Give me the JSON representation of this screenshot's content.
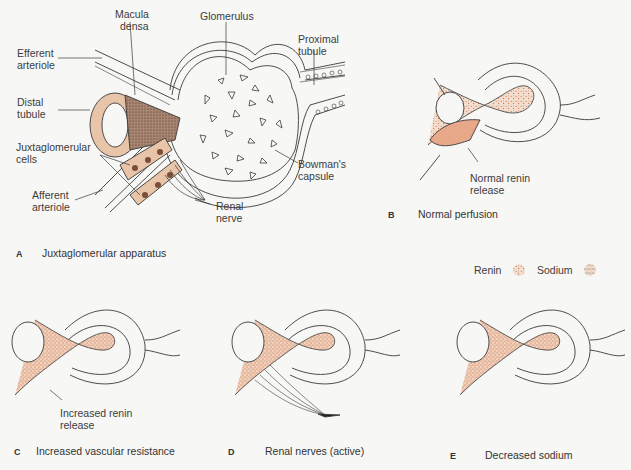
{
  "colors": {
    "background": "#f7f7f5",
    "line": "#3a3a3a",
    "cell_fill": "#e8c4a8",
    "renin": "#d9734e",
    "sodium": "#333333",
    "tube_fill": "#f2dccb",
    "macula_fill": "#8a6a58",
    "nucleus": "#7a4e38"
  },
  "panel_a": {
    "letter": "A",
    "caption": "Juxtaglomerular apparatus",
    "labels": {
      "macula_densa_1": "Macula",
      "macula_densa_2": "densa",
      "glomerulus": "Glomerulus",
      "proximal_tubule_1": "Proximal",
      "proximal_tubule_2": "tubule",
      "efferent_arteriole_1": "Efferent",
      "efferent_arteriole_2": "arteriole",
      "distal_tubule_1": "Distal",
      "distal_tubule_2": "tubule",
      "juxtaglomerular_cells_1": "Juxtaglomerular",
      "juxtaglomerular_cells_2": "cells",
      "afferent_arteriole_1": "Afferent",
      "afferent_arteriole_2": "arteriole",
      "bowmans_capsule_1": "Bowman's",
      "bowmans_capsule_2": "capsule",
      "renal_nerve_1": "Renal",
      "renal_nerve_2": "nerve"
    }
  },
  "panel_b": {
    "letter": "B",
    "caption": "Normal perfusion",
    "annotation_1": "Normal renin",
    "annotation_2": "release"
  },
  "legend": {
    "renin_label": "Renin",
    "sodium_label": "Sodium"
  },
  "panel_c": {
    "letter": "C",
    "caption": "Increased vascular resistance",
    "annotation_1": "Increased renin",
    "annotation_2": "release"
  },
  "panel_d": {
    "letter": "D",
    "caption": "Renal nerves (active)"
  },
  "panel_e": {
    "letter": "E",
    "caption": "Decreased sodium"
  }
}
